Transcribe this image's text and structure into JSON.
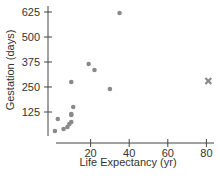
{
  "chart_data": {
    "type": "scatter",
    "title": "",
    "xlabel": "Life Expectancy (yr)",
    "ylabel": "Gestation (days)",
    "xticks": [
      20,
      40,
      60,
      80
    ],
    "yticks": [
      125,
      250,
      375,
      500,
      625
    ],
    "xlim": [
      0,
      82
    ],
    "ylim": [
      0,
      640
    ],
    "grid": false,
    "points": [
      {
        "x": 1.5,
        "y": 30
      },
      {
        "x": 3,
        "y": 90
      },
      {
        "x": 6,
        "y": 40
      },
      {
        "x": 8,
        "y": 50
      },
      {
        "x": 9,
        "y": 65
      },
      {
        "x": 10,
        "y": 75
      },
      {
        "x": 10,
        "y": 110
      },
      {
        "x": 10,
        "y": 115
      },
      {
        "x": 11,
        "y": 150
      },
      {
        "x": 10,
        "y": 275
      },
      {
        "x": 19,
        "y": 365
      },
      {
        "x": 22,
        "y": 335
      },
      {
        "x": 30,
        "y": 240
      },
      {
        "x": 35,
        "y": 620
      }
    ],
    "outliers": [
      {
        "x": 81,
        "y": 280,
        "marker": "x"
      }
    ],
    "colors": {
      "point": "#8a8a8a",
      "axis": "#444444"
    }
  }
}
